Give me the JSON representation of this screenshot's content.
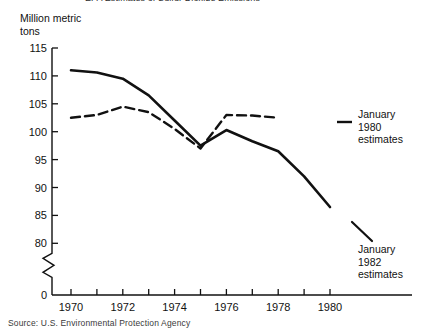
{
  "title_clipped": "EPA Estimates of Sulfur Dioxide Emissions",
  "axis_caption": "Million metric\ntons",
  "source_note": "Source:  U.S. Environmental Protection Agency",
  "annotations": {
    "dashed": "January\n1980\nestimates",
    "solid": "January\n1982\nestimates"
  },
  "chart_data": {
    "type": "line",
    "title": "EPA Estimates of Sulfur Dioxide Emissions",
    "xlabel": "",
    "ylabel": "Million metric tons",
    "ylim": [
      80,
      115
    ],
    "y_axis_break_below": 80,
    "y_zero_label": "0",
    "yticks": [
      80,
      85,
      90,
      95,
      100,
      105,
      110,
      115
    ],
    "xlim": [
      1970,
      1980
    ],
    "xticks": [
      1970,
      1971,
      1972,
      1973,
      1974,
      1975,
      1976,
      1977,
      1978,
      1979,
      1980
    ],
    "xticklabels": [
      "1970",
      "",
      "1972",
      "",
      "1974",
      "",
      "1976",
      "",
      "1978",
      "",
      "1980"
    ],
    "grid": false,
    "legend": "annotated-inline",
    "x": [
      1970,
      1971,
      1972,
      1973,
      1974,
      1975,
      1976,
      1977,
      1978,
      1979,
      1980
    ],
    "series": [
      {
        "name": "January 1982 estimates",
        "style": "solid",
        "color": "#111111",
        "x": [
          1970,
          1971,
          1972,
          1973,
          1974,
          1975,
          1976,
          1977,
          1978,
          1979,
          1980
        ],
        "values": [
          111.0,
          110.6,
          109.5,
          106.5,
          102.0,
          97.5,
          100.3,
          98.3,
          96.5,
          92.0,
          86.5
        ]
      },
      {
        "name": "January 1980 estimates",
        "style": "dashed",
        "color": "#111111",
        "x": [
          1970,
          1971,
          1972,
          1973,
          1974,
          1975,
          1976,
          1977,
          1978
        ],
        "values": [
          102.5,
          103.0,
          104.5,
          103.5,
          100.5,
          97.0,
          103.0,
          102.9,
          102.5
        ]
      }
    ]
  }
}
